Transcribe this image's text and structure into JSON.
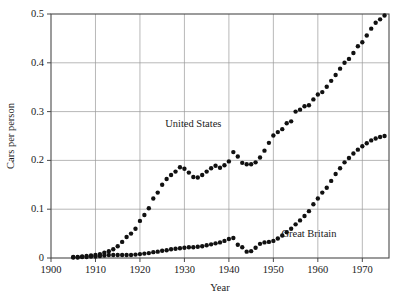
{
  "chart_data": {
    "type": "scatter",
    "title": "",
    "xlabel": "Year",
    "ylabel": "Cars per person",
    "xlim": [
      1900,
      1976
    ],
    "ylim": [
      0,
      0.5
    ],
    "grid": true,
    "legend_position": "inline-annotations",
    "xticks": [
      1900,
      1910,
      1920,
      1930,
      1940,
      1950,
      1960,
      1970
    ],
    "xticklabels": [
      "1900",
      "1910",
      "1920",
      "1930",
      "1940",
      "1950",
      "1960",
      "1970"
    ],
    "yticks": [
      0,
      0.1,
      0.2,
      0.3,
      0.4,
      0.5
    ],
    "yticklabels": [
      "0",
      "0.1",
      "0.2",
      "0.3",
      "0.4",
      "0.5"
    ],
    "marker": "filled-circle",
    "marker_color": "#111111",
    "annotations": [
      {
        "text": "United States",
        "x": 1932,
        "y": 0.268
      },
      {
        "text": "Great Britain",
        "x": 1958,
        "y": 0.043
      }
    ],
    "series": [
      {
        "name": "United States",
        "color": "#111111",
        "x": [
          1905,
          1906,
          1907,
          1908,
          1909,
          1910,
          1911,
          1912,
          1913,
          1914,
          1915,
          1916,
          1917,
          1918,
          1919,
          1920,
          1921,
          1922,
          1923,
          1924,
          1925,
          1926,
          1927,
          1928,
          1929,
          1930,
          1931,
          1932,
          1933,
          1934,
          1935,
          1936,
          1937,
          1938,
          1939,
          1940,
          1941,
          1942,
          1943,
          1944,
          1945,
          1946,
          1947,
          1948,
          1949,
          1950,
          1951,
          1952,
          1953,
          1954,
          1955,
          1956,
          1957,
          1958,
          1959,
          1960,
          1961,
          1962,
          1963,
          1964,
          1965,
          1966,
          1967,
          1968,
          1969,
          1970,
          1971,
          1972,
          1973,
          1974,
          1975
        ],
        "y": [
          0.002,
          0.002,
          0.003,
          0.004,
          0.005,
          0.006,
          0.008,
          0.011,
          0.014,
          0.018,
          0.024,
          0.033,
          0.043,
          0.05,
          0.06,
          0.076,
          0.088,
          0.102,
          0.122,
          0.134,
          0.15,
          0.162,
          0.17,
          0.177,
          0.186,
          0.183,
          0.175,
          0.166,
          0.165,
          0.17,
          0.177,
          0.184,
          0.189,
          0.185,
          0.19,
          0.198,
          0.217,
          0.208,
          0.195,
          0.192,
          0.192,
          0.196,
          0.206,
          0.22,
          0.236,
          0.251,
          0.258,
          0.264,
          0.276,
          0.28,
          0.3,
          0.304,
          0.311,
          0.313,
          0.325,
          0.335,
          0.34,
          0.351,
          0.363,
          0.375,
          0.388,
          0.4,
          0.408,
          0.42,
          0.434,
          0.442,
          0.456,
          0.47,
          0.482,
          0.489,
          0.497
        ]
      },
      {
        "name": "Great Britain",
        "color": "#111111",
        "x": [
          1905,
          1906,
          1907,
          1908,
          1909,
          1910,
          1911,
          1912,
          1913,
          1914,
          1915,
          1916,
          1917,
          1918,
          1919,
          1920,
          1921,
          1922,
          1923,
          1924,
          1925,
          1926,
          1927,
          1928,
          1929,
          1930,
          1931,
          1932,
          1933,
          1934,
          1935,
          1936,
          1937,
          1938,
          1939,
          1940,
          1941,
          1942,
          1943,
          1944,
          1945,
          1946,
          1947,
          1948,
          1949,
          1950,
          1951,
          1952,
          1953,
          1954,
          1955,
          1956,
          1957,
          1958,
          1959,
          1960,
          1961,
          1962,
          1963,
          1964,
          1965,
          1966,
          1967,
          1968,
          1969,
          1970,
          1971,
          1972,
          1973,
          1974,
          1975
        ],
        "y": [
          0.001,
          0.001,
          0.002,
          0.002,
          0.003,
          0.003,
          0.004,
          0.005,
          0.006,
          0.006,
          0.006,
          0.006,
          0.006,
          0.006,
          0.007,
          0.008,
          0.009,
          0.01,
          0.012,
          0.013,
          0.015,
          0.016,
          0.018,
          0.019,
          0.02,
          0.021,
          0.022,
          0.022,
          0.023,
          0.024,
          0.026,
          0.028,
          0.03,
          0.032,
          0.035,
          0.039,
          0.041,
          0.027,
          0.022,
          0.013,
          0.014,
          0.021,
          0.029,
          0.032,
          0.033,
          0.035,
          0.04,
          0.046,
          0.053,
          0.06,
          0.069,
          0.077,
          0.086,
          0.096,
          0.11,
          0.122,
          0.134,
          0.144,
          0.158,
          0.172,
          0.184,
          0.196,
          0.205,
          0.214,
          0.222,
          0.229,
          0.235,
          0.241,
          0.245,
          0.248,
          0.25
        ]
      }
    ]
  }
}
